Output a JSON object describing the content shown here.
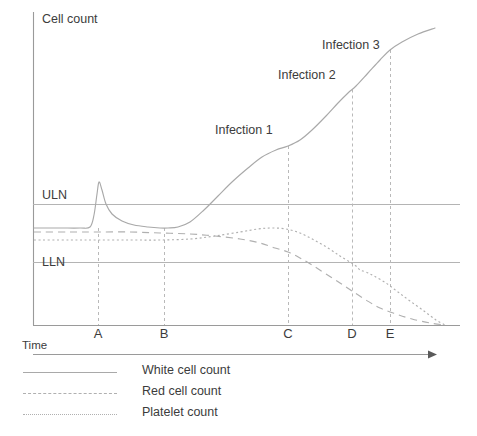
{
  "chart_data": {
    "type": "line",
    "title": "",
    "xlabel": "Time",
    "ylabel": "Cell count",
    "grid": false,
    "legend_position": "bottom-left",
    "x_tick_labels": [
      "A",
      "B",
      "C",
      "D",
      "E"
    ],
    "x_tick_positions_px": [
      98,
      164,
      288,
      352,
      390
    ],
    "reference_lines": [
      {
        "label": "ULN",
        "name": "upper-limit-of-normal",
        "y_px": 204
      },
      {
        "label": "LLN",
        "name": "lower-limit-of-normal",
        "y_px": 262
      }
    ],
    "annotations": [
      {
        "label": "Infection 1",
        "x_px": 215,
        "y_px": 123,
        "guide_x_px": 288
      },
      {
        "label": "Infection 2",
        "x_px": 278,
        "y_px": 68,
        "guide_x_px": 352
      },
      {
        "label": "Infection 3",
        "x_px": 322,
        "y_px": 38,
        "guide_x_px": 390
      }
    ],
    "series": [
      {
        "name": "White cell count",
        "style": "solid",
        "color": "#a9a9a9",
        "points_px": [
          [
            34,
            228
          ],
          [
            60,
            228
          ],
          [
            80,
            228
          ],
          [
            90,
            227
          ],
          [
            94,
            215
          ],
          [
            97,
            194
          ],
          [
            99,
            182
          ],
          [
            102,
            190
          ],
          [
            106,
            204
          ],
          [
            112,
            214
          ],
          [
            122,
            221
          ],
          [
            134,
            225
          ],
          [
            148,
            227
          ],
          [
            160,
            228
          ],
          [
            168,
            228
          ],
          [
            178,
            227
          ],
          [
            190,
            222
          ],
          [
            204,
            210
          ],
          [
            218,
            196
          ],
          [
            232,
            182
          ],
          [
            248,
            168
          ],
          [
            262,
            157
          ],
          [
            276,
            150
          ],
          [
            288,
            146
          ],
          [
            300,
            140
          ],
          [
            312,
            130
          ],
          [
            326,
            116
          ],
          [
            338,
            103
          ],
          [
            348,
            93
          ],
          [
            356,
            86
          ],
          [
            368,
            73
          ],
          [
            380,
            60
          ],
          [
            390,
            50
          ],
          [
            402,
            42
          ],
          [
            418,
            34
          ],
          [
            435,
            28
          ]
        ]
      },
      {
        "name": "Red cell count",
        "style": "dashed",
        "color": "#b0b0b0",
        "points_px": [
          [
            34,
            232
          ],
          [
            70,
            232
          ],
          [
            98,
            232
          ],
          [
            130,
            232
          ],
          [
            160,
            233
          ],
          [
            190,
            234
          ],
          [
            215,
            236
          ],
          [
            240,
            239
          ],
          [
            260,
            243
          ],
          [
            275,
            248
          ],
          [
            288,
            252
          ],
          [
            300,
            258
          ],
          [
            312,
            265
          ],
          [
            326,
            274
          ],
          [
            340,
            283
          ],
          [
            352,
            291
          ],
          [
            366,
            300
          ],
          [
            380,
            308
          ],
          [
            396,
            314
          ],
          [
            412,
            319
          ],
          [
            430,
            323
          ],
          [
            445,
            325
          ]
        ]
      },
      {
        "name": "Platelet count",
        "style": "dotted",
        "color": "#b0b0b0",
        "points_px": [
          [
            34,
            240
          ],
          [
            70,
            240
          ],
          [
            98,
            240
          ],
          [
            130,
            240
          ],
          [
            160,
            240
          ],
          [
            190,
            239
          ],
          [
            215,
            236
          ],
          [
            240,
            232
          ],
          [
            258,
            229
          ],
          [
            272,
            228
          ],
          [
            286,
            229
          ],
          [
            300,
            233
          ],
          [
            314,
            240
          ],
          [
            328,
            248
          ],
          [
            340,
            256
          ],
          [
            350,
            262
          ],
          [
            356,
            266
          ],
          [
            360,
            270
          ],
          [
            366,
            272
          ],
          [
            374,
            276
          ],
          [
            386,
            283
          ],
          [
            398,
            292
          ],
          [
            410,
            301
          ],
          [
            424,
            311
          ],
          [
            436,
            320
          ],
          [
            445,
            325
          ]
        ]
      }
    ]
  },
  "axes": {
    "y_label": "Cell count",
    "x_label": "Time",
    "y_axis_top_px": 12,
    "baseline_y_px": 325,
    "x_axis_y_px": 354,
    "x_axis_end_px": 435
  },
  "legend": {
    "items": [
      {
        "label": "White cell count",
        "style": "solid"
      },
      {
        "label": "Red cell count",
        "style": "dashed"
      },
      {
        "label": "Platelet count",
        "style": "dotted"
      }
    ]
  },
  "colors": {
    "series_white": "#a9a9a9",
    "series_red": "#b0b0b0",
    "series_platelet": "#b0b0b0",
    "reference": "#b4b4b4",
    "axis": "#9a9a9a",
    "text": "#3c3c3c",
    "background": "#ffffff"
  }
}
